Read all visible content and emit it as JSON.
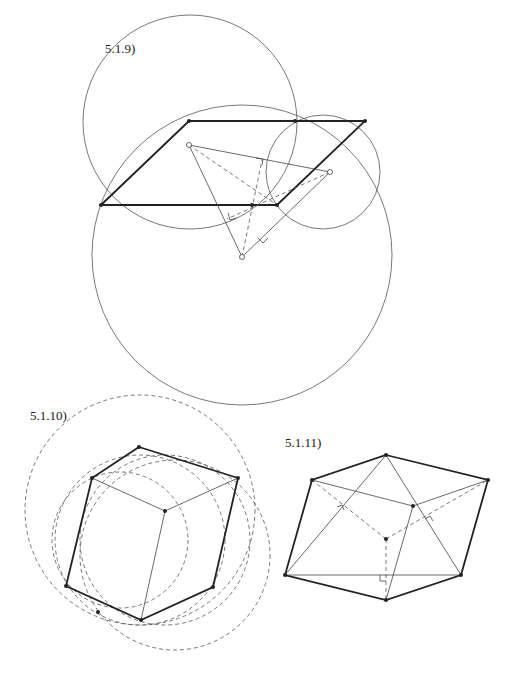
{
  "figures": [
    {
      "id": "fig-5-1-9",
      "label": "5.1.9)",
      "label_pos": [
        105,
        53
      ],
      "circles": [
        {
          "cx": 190,
          "cy": 122,
          "r": 107,
          "style": "solid"
        },
        {
          "cx": 242,
          "cy": 255,
          "r": 150,
          "style": "solid"
        },
        {
          "cx": 323,
          "cy": 172,
          "r": 57,
          "style": "solid"
        }
      ],
      "parallelogram": [
        [
          101,
          205
        ],
        [
          189,
          121
        ],
        [
          365,
          121
        ],
        [
          277,
          205
        ]
      ],
      "triangle": [
        [
          189,
          145
        ],
        [
          330,
          172
        ],
        [
          242,
          257
        ]
      ],
      "center_point": [
        252,
        205
      ],
      "dashed_lines": [
        [
          [
            189,
            145
          ],
          [
            277,
            205
          ]
        ],
        [
          [
            330,
            172
          ],
          [
            227,
            219
          ]
        ],
        [
          [
            242,
            257
          ],
          [
            262,
            160
          ]
        ]
      ],
      "right_angle_marks": [
        [
          258,
          160
        ],
        [
          230,
          214
        ],
        [
          262,
          240
        ]
      ]
    },
    {
      "id": "fig-5-1-10",
      "label": "5.1.10)",
      "label_pos": [
        30,
        420
      ],
      "hexagon": [
        [
          139,
          447
        ],
        [
          238,
          478
        ],
        [
          213,
          587
        ],
        [
          141,
          620
        ],
        [
          66,
          586
        ],
        [
          92,
          478
        ]
      ],
      "center_point": [
        165,
        511
      ],
      "spokes": [
        [
          [
            165,
            511
          ],
          [
            92,
            478
          ]
        ],
        [
          [
            165,
            511
          ],
          [
            238,
            478
          ]
        ],
        [
          [
            165,
            511
          ],
          [
            141,
            620
          ]
        ]
      ],
      "dashed_circles": [
        {
          "cx": 140,
          "cy": 510,
          "r": 115
        },
        {
          "cx": 165,
          "cy": 540,
          "r": 85
        },
        {
          "cx": 140,
          "cy": 540,
          "r": 85
        },
        {
          "cx": 175,
          "cy": 555,
          "r": 95
        },
        {
          "cx": 120,
          "cy": 540,
          "r": 68
        }
      ],
      "extra_point": [
        98,
        612
      ]
    },
    {
      "id": "fig-5-1-11",
      "label": "5.1.11)",
      "label_pos": [
        285,
        447
      ],
      "hexagon": [
        [
          386,
          455
        ],
        [
          488,
          480
        ],
        [
          461,
          575
        ],
        [
          386,
          600
        ],
        [
          285,
          575
        ],
        [
          312,
          480
        ]
      ],
      "inner_point": [
        413,
        506
      ],
      "center_point": [
        386,
        539
      ],
      "thin_lines": [
        [
          [
            312,
            480
          ],
          [
            413,
            506
          ]
        ],
        [
          [
            413,
            506
          ],
          [
            488,
            480
          ]
        ],
        [
          [
            413,
            506
          ],
          [
            386,
            600
          ]
        ],
        [
          [
            386,
            455
          ],
          [
            285,
            575
          ]
        ],
        [
          [
            386,
            455
          ],
          [
            461,
            575
          ]
        ],
        [
          [
            285,
            575
          ],
          [
            461,
            575
          ]
        ]
      ],
      "dashed_lines": [
        [
          [
            386,
            539
          ],
          [
            312,
            480
          ]
        ],
        [
          [
            386,
            539
          ],
          [
            488,
            480
          ]
        ],
        [
          [
            386,
            539
          ],
          [
            386,
            600
          ]
        ]
      ]
    }
  ]
}
